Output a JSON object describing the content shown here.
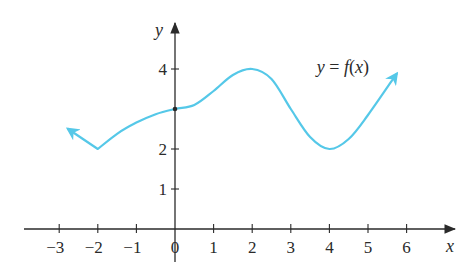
{
  "chart_data": {
    "type": "line",
    "title": "",
    "xlabel": "x",
    "ylabel": "y",
    "xlim": [
      -3.5,
      7.0
    ],
    "ylim": [
      0,
      5.2
    ],
    "grid": false,
    "x_ticks": [
      -3,
      -2,
      -1,
      0,
      1,
      2,
      3,
      4,
      5,
      6
    ],
    "x_tick_labels": [
      "−3",
      "−2",
      "−1",
      "0",
      "1",
      "2",
      "3",
      "4",
      "5",
      "6"
    ],
    "y_ticks": [
      1,
      2,
      4
    ],
    "y_tick_labels": [
      "1",
      "2",
      "4"
    ],
    "series": [
      {
        "name": "y = f(x)",
        "color": "#55C8E8",
        "arrow_start": true,
        "arrow_end": true,
        "points": [
          {
            "x": -2.77,
            "y": 2.5
          },
          {
            "x": -2.0,
            "y": 2.0
          },
          {
            "x": -1.5,
            "y": 2.38
          },
          {
            "x": -1.0,
            "y": 2.66
          },
          {
            "x": -0.5,
            "y": 2.87
          },
          {
            "x": 0.0,
            "y": 3.0
          },
          {
            "x": 0.5,
            "y": 3.1
          },
          {
            "x": 1.0,
            "y": 3.45
          },
          {
            "x": 1.5,
            "y": 3.85
          },
          {
            "x": 2.0,
            "y": 4.0
          },
          {
            "x": 2.5,
            "y": 3.75
          },
          {
            "x": 3.0,
            "y": 3.0
          },
          {
            "x": 3.5,
            "y": 2.3
          },
          {
            "x": 4.0,
            "y": 2.0
          },
          {
            "x": 4.5,
            "y": 2.25
          },
          {
            "x": 5.0,
            "y": 2.85
          },
          {
            "x": 5.74,
            "y": 3.88
          }
        ]
      }
    ],
    "annotations": [
      {
        "text": "y = f(x)",
        "x": 3.75,
        "y": 4.05
      },
      {
        "marker": "dot",
        "x": 0,
        "y": 3
      }
    ]
  },
  "labels": {
    "x_axis": "x",
    "y_axis": "y",
    "curve": "y = f(x)"
  }
}
